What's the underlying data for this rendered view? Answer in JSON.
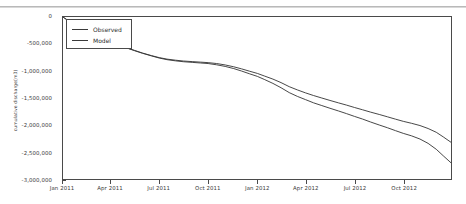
{
  "chart_data": {
    "type": "line",
    "title": "",
    "xlabel": "",
    "ylabel": "cumulative discharge(m3)",
    "ylim": [
      0,
      -3000000
    ],
    "y_inverted": true,
    "grid": false,
    "legend_position": "upper left",
    "y_ticks": [
      {
        "value": -3000000,
        "label": "-3,000,000"
      },
      {
        "value": -2500000,
        "label": "-2,500,000"
      },
      {
        "value": -2000000,
        "label": "-2,000,000"
      },
      {
        "value": -1500000,
        "label": "-1,500,000"
      },
      {
        "value": -1000000,
        "label": "-1,000,000"
      },
      {
        "value": -500000,
        "label": "-500,000"
      },
      {
        "value": 0,
        "label": "0"
      }
    ],
    "x_ticks": [
      {
        "pos": 0.0,
        "label": "Jan 2011"
      },
      {
        "pos": 0.1233,
        "label": "Apr 2011"
      },
      {
        "pos": 0.2479,
        "label": "Jul 2011"
      },
      {
        "pos": 0.374,
        "label": "Oct 2011"
      },
      {
        "pos": 0.5007,
        "label": "Jan 2012"
      },
      {
        "pos": 0.6253,
        "label": "Apr 2012"
      },
      {
        "pos": 0.7513,
        "label": "Jul 2012"
      },
      {
        "pos": 0.8773,
        "label": "Oct 2012"
      }
    ],
    "categories": [
      "Jan 2011",
      "Apr 2011",
      "Jul 2011",
      "Oct 2011",
      "Jan 2012",
      "Apr 2012",
      "Jul 2012",
      "Oct 2012"
    ],
    "series": [
      {
        "name": "Observed",
        "color": "#333333",
        "x": [
          0.0,
          0.018,
          0.035,
          0.052,
          0.07,
          0.088,
          0.105,
          0.123,
          0.143,
          0.163,
          0.185,
          0.205,
          0.228,
          0.248,
          0.268,
          0.29,
          0.31,
          0.333,
          0.355,
          0.374,
          0.396,
          0.418,
          0.44,
          0.46,
          0.48,
          0.501,
          0.52,
          0.541,
          0.562,
          0.583,
          0.604,
          0.625,
          0.646,
          0.667,
          0.688,
          0.71,
          0.731,
          0.751,
          0.772,
          0.793,
          0.815,
          0.836,
          0.857,
          0.877,
          0.898,
          0.92,
          0.941,
          0.962,
          0.98,
          1.0
        ],
        "y": [
          0,
          -95000,
          -175000,
          -250000,
          -320000,
          -380000,
          -430000,
          -470000,
          -520000,
          -570000,
          -625000,
          -672000,
          -720000,
          -760000,
          -790000,
          -812000,
          -828000,
          -840000,
          -852000,
          -862000,
          -885000,
          -915000,
          -955000,
          -1000000,
          -1050000,
          -1100000,
          -1160000,
          -1230000,
          -1310000,
          -1400000,
          -1470000,
          -1530000,
          -1590000,
          -1640000,
          -1690000,
          -1740000,
          -1790000,
          -1840000,
          -1890000,
          -1945000,
          -2000000,
          -2050000,
          -2105000,
          -2155000,
          -2200000,
          -2260000,
          -2340000,
          -2450000,
          -2570000,
          -2700000
        ]
      },
      {
        "name": "Model",
        "color": "#333333",
        "x": [
          0.0,
          0.018,
          0.035,
          0.052,
          0.07,
          0.088,
          0.105,
          0.123,
          0.143,
          0.163,
          0.185,
          0.205,
          0.228,
          0.248,
          0.268,
          0.29,
          0.31,
          0.333,
          0.355,
          0.374,
          0.396,
          0.418,
          0.44,
          0.46,
          0.48,
          0.501,
          0.52,
          0.541,
          0.562,
          0.583,
          0.604,
          0.625,
          0.646,
          0.667,
          0.688,
          0.71,
          0.731,
          0.751,
          0.772,
          0.793,
          0.815,
          0.836,
          0.857,
          0.877,
          0.898,
          0.92,
          0.941,
          0.962,
          0.98,
          1.0
        ],
        "y": [
          0,
          -88000,
          -165000,
          -240000,
          -310000,
          -372000,
          -425000,
          -468000,
          -518000,
          -568000,
          -620000,
          -668000,
          -715000,
          -752000,
          -780000,
          -800000,
          -815000,
          -826000,
          -836000,
          -845000,
          -862000,
          -888000,
          -922000,
          -960000,
          -1002000,
          -1045000,
          -1095000,
          -1150000,
          -1215000,
          -1290000,
          -1350000,
          -1405000,
          -1455000,
          -1500000,
          -1545000,
          -1590000,
          -1632000,
          -1675000,
          -1718000,
          -1762000,
          -1805000,
          -1848000,
          -1892000,
          -1932000,
          -1968000,
          -2010000,
          -2065000,
          -2135000,
          -2220000,
          -2320000
        ]
      }
    ]
  },
  "legend": {
    "items": [
      {
        "label": "Observed"
      },
      {
        "label": "Model"
      }
    ]
  }
}
